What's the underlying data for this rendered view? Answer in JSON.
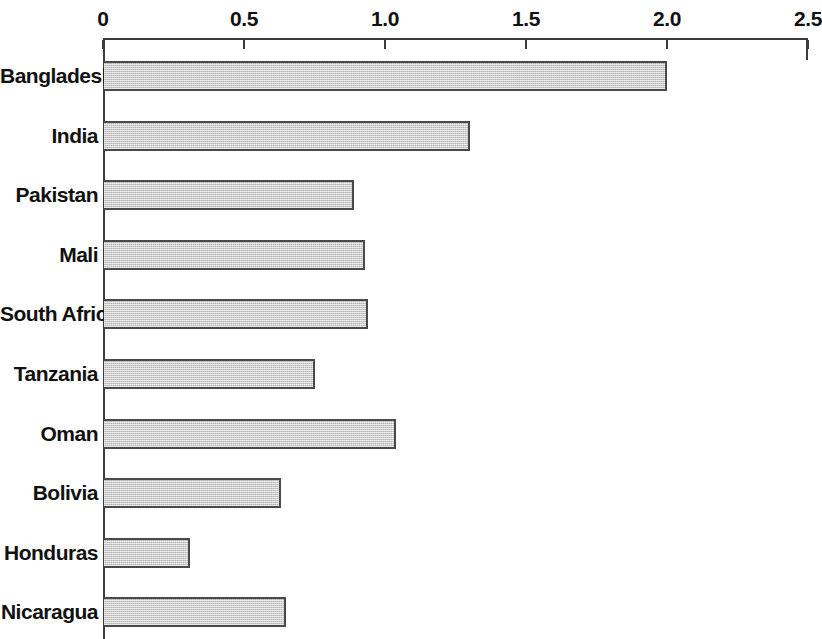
{
  "chart_data": {
    "type": "bar",
    "orientation": "horizontal",
    "title": "",
    "subtitle": "",
    "xlabel": "",
    "ylabel": "",
    "xlim": [
      0,
      2.5
    ],
    "grid": false,
    "legend": null,
    "tick_labels": [
      "0",
      "0.5",
      "1.0",
      "1.5",
      "2.0",
      "2.5"
    ],
    "tick_values": [
      0,
      0.5,
      1.0,
      1.5,
      2.0,
      2.5
    ],
    "categories": [
      "Bangladesh",
      "India",
      "Pakistan",
      "Mali",
      "South Africa",
      "Tanzania",
      "Oman",
      "Bolivia",
      "Honduras",
      "Nicaragua"
    ],
    "values": [
      2.0,
      1.3,
      0.89,
      0.93,
      0.94,
      0.75,
      1.04,
      0.63,
      0.31,
      0.65
    ],
    "bars": [
      {
        "category": "Bangladesh",
        "value": 2.0
      },
      {
        "category": "India",
        "value": 1.3
      },
      {
        "category": "Pakistan",
        "value": 0.89
      },
      {
        "category": "Mali",
        "value": 0.93
      },
      {
        "category": "South Africa",
        "value": 0.94
      },
      {
        "category": "Tanzania",
        "value": 0.75
      },
      {
        "category": "Oman",
        "value": 1.04
      },
      {
        "category": "Bolivia",
        "value": 0.63
      },
      {
        "category": "Honduras",
        "value": 0.31
      },
      {
        "category": "Nicaragua",
        "value": 0.65
      }
    ],
    "colors": {
      "bar_fill": "#c6c6c6",
      "bar_stroke": "#4a4a4a",
      "axis": "#3b3b3b",
      "text": "#111111",
      "background": "#ffffff"
    }
  },
  "layout": {
    "plot_left_px": 103,
    "plot_right_px": 808,
    "axis_top_px": 38,
    "row_pitch_px": 59.6,
    "first_bar_top_px": 61,
    "bar_height_px": 30
  }
}
